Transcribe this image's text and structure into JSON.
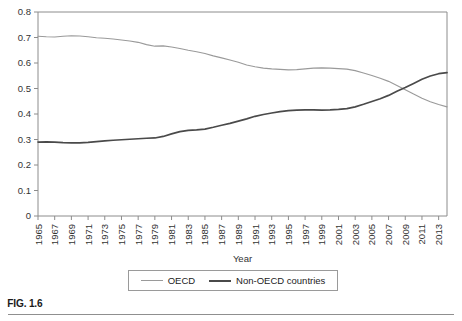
{
  "figure": {
    "caption": "FIG. 1.6"
  },
  "legend": {
    "position": "bottom-center",
    "entries": [
      {
        "label": "OECD",
        "color": "#9a9a9a"
      },
      {
        "label": "Non-OECD countries",
        "color": "#4a4a4a"
      }
    ]
  },
  "chart_data": {
    "type": "line",
    "title": "",
    "subtitle": "",
    "xlabel": "Year",
    "ylabel": "",
    "grid": false,
    "legend_position": "bottom-center",
    "xlim": [
      1965,
      2014
    ],
    "ylim": [
      0,
      0.8
    ],
    "ytick_labels": [
      "0",
      "0.1",
      "0.2",
      "0.3",
      "0.4",
      "0.5",
      "0.6",
      "0.7",
      "0.8"
    ],
    "ytick_values": [
      0,
      0.1,
      0.2,
      0.3,
      0.4,
      0.5,
      0.6,
      0.7,
      0.8
    ],
    "xtick_labels": [
      "1965",
      "1967",
      "1969",
      "1971",
      "1973",
      "1975",
      "1977",
      "1979",
      "1981",
      "1983",
      "1985",
      "1987",
      "1989",
      "1991",
      "1993",
      "1995",
      "1997",
      "1999",
      "2001",
      "2003",
      "2005",
      "2007",
      "2009",
      "2011",
      "2013"
    ],
    "xtick_values": [
      1965,
      1967,
      1969,
      1971,
      1973,
      1975,
      1977,
      1979,
      1981,
      1983,
      1985,
      1987,
      1989,
      1991,
      1993,
      1995,
      1997,
      1999,
      2001,
      2003,
      2005,
      2007,
      2009,
      2011,
      2013
    ],
    "x": [
      1965,
      1966,
      1967,
      1968,
      1969,
      1970,
      1971,
      1972,
      1973,
      1974,
      1975,
      1976,
      1977,
      1978,
      1979,
      1980,
      1981,
      1982,
      1983,
      1984,
      1985,
      1986,
      1987,
      1988,
      1989,
      1990,
      1991,
      1992,
      1993,
      1994,
      1995,
      1996,
      1997,
      1998,
      1999,
      2000,
      2001,
      2002,
      2003,
      2004,
      2005,
      2006,
      2007,
      2008,
      2009,
      2010,
      2011,
      2012,
      2013,
      2014
    ],
    "series": [
      {
        "name": "OECD",
        "color": "#9a9a9a",
        "values": [
          0.705,
          0.703,
          0.702,
          0.705,
          0.707,
          0.706,
          0.703,
          0.699,
          0.697,
          0.694,
          0.69,
          0.686,
          0.681,
          0.672,
          0.666,
          0.667,
          0.663,
          0.657,
          0.65,
          0.644,
          0.637,
          0.628,
          0.62,
          0.612,
          0.603,
          0.592,
          0.585,
          0.58,
          0.577,
          0.575,
          0.573,
          0.574,
          0.577,
          0.58,
          0.581,
          0.58,
          0.578,
          0.576,
          0.57,
          0.561,
          0.551,
          0.54,
          0.528,
          0.512,
          0.495,
          0.478,
          0.462,
          0.448,
          0.437,
          0.428
        ]
      },
      {
        "name": "Non-OECD countries",
        "color": "#4a4a4a",
        "values": [
          0.29,
          0.291,
          0.29,
          0.288,
          0.287,
          0.287,
          0.289,
          0.292,
          0.295,
          0.297,
          0.299,
          0.301,
          0.303,
          0.305,
          0.306,
          0.312,
          0.322,
          0.331,
          0.336,
          0.338,
          0.341,
          0.348,
          0.356,
          0.363,
          0.372,
          0.381,
          0.391,
          0.398,
          0.404,
          0.409,
          0.413,
          0.415,
          0.416,
          0.416,
          0.415,
          0.416,
          0.418,
          0.421,
          0.428,
          0.438,
          0.449,
          0.46,
          0.473,
          0.489,
          0.504,
          0.52,
          0.536,
          0.549,
          0.558,
          0.562
        ]
      }
    ],
    "annotations": [
      {
        "text": "crossover",
        "x": 2007.5,
        "y": 0.497
      }
    ]
  }
}
